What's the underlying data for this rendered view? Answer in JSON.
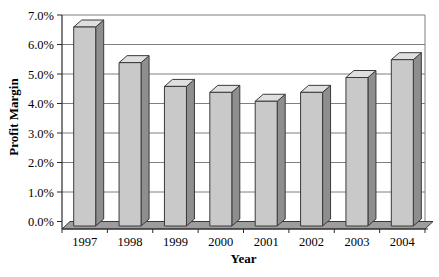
{
  "chart_data": {
    "type": "bar",
    "title": "",
    "xlabel": "Year",
    "ylabel": "Profit Margin",
    "categories": [
      "1997",
      "1998",
      "1999",
      "2000",
      "2001",
      "2002",
      "2003",
      "2004"
    ],
    "values": [
      6.7,
      5.5,
      4.7,
      4.5,
      4.2,
      4.5,
      5.0,
      5.6
    ],
    "unit": "percent",
    "ylim": [
      0,
      7
    ],
    "y_tick_step": 1,
    "y_tick_labels": [
      "0.0%",
      "1.0%",
      "2.0%",
      "3.0%",
      "4.0%",
      "5.0%",
      "6.0%",
      "7.0%"
    ],
    "grid": true,
    "legend": "none",
    "bar_style": "3d-extruded",
    "colors": {
      "background": "#ffffff",
      "bar_front": "#c9c9c9",
      "bar_top": "#dfdfdf",
      "bar_side": "#8e8e8e",
      "bar_border": "#3a3a3a",
      "floor_fill": "#9d9d9d",
      "floor_border": "#3a3a3a",
      "gridline": "#7f7f7f",
      "axis_line": "#2b2b2b",
      "text": "#000000"
    }
  }
}
